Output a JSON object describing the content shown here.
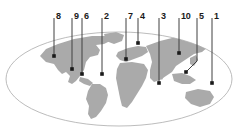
{
  "figure": {
    "width": 238,
    "height": 138,
    "background_color": "#ffffff"
  },
  "map": {
    "name": "world-map",
    "projection": "mollweide-ellipse",
    "land_color": "#aaaaaa",
    "ocean_color": "#ffffff",
    "outline_color": "#b4b4b4",
    "ellipse": {
      "cx": 119,
      "cy": 79,
      "rx": 113,
      "ry": 47
    }
  },
  "callouts": {
    "label_color": "#1a1a1a",
    "line_color": "#404040",
    "marker_color": "#1a1a1a",
    "items": [
      {
        "id": "callout-8",
        "label": "8",
        "label_x": 56,
        "label_y": 12,
        "line_x": 54,
        "line_y1": 18,
        "line_y2": 56,
        "dot_x": 54,
        "dot_y": 56,
        "bent": false
      },
      {
        "id": "callout-9",
        "label": "9",
        "label_x": 74,
        "label_y": 12,
        "line_x": 72,
        "line_y1": 18,
        "line_y2": 69,
        "dot_x": 72,
        "dot_y": 69,
        "bent": false
      },
      {
        "id": "callout-6",
        "label": "6",
        "label_x": 84,
        "label_y": 12,
        "line_x": 82,
        "line_y1": 18,
        "line_y2": 74,
        "dot_x": 82,
        "dot_y": 74,
        "bent": false
      },
      {
        "id": "callout-2",
        "label": "2",
        "label_x": 104,
        "label_y": 12,
        "line_x": 102,
        "line_y1": 18,
        "line_y2": 74,
        "dot_x": 102,
        "dot_y": 74,
        "bent": false
      },
      {
        "id": "callout-7",
        "label": "7",
        "label_x": 128,
        "label_y": 12,
        "line_x": 126,
        "line_y1": 18,
        "line_y2": 59,
        "dot_x": 126,
        "dot_y": 59,
        "bent": false
      },
      {
        "id": "callout-4",
        "label": "4",
        "label_x": 140,
        "label_y": 12,
        "line_x": 138,
        "line_y1": 18,
        "line_y2": 43,
        "dot_x": 138,
        "dot_y": 43,
        "bent": false
      },
      {
        "id": "callout-3",
        "label": "3",
        "label_x": 161,
        "label_y": 12,
        "line_x": 159,
        "line_y1": 18,
        "line_y2": 83,
        "dot_x": 159,
        "dot_y": 83,
        "bent": false
      },
      {
        "id": "callout-10",
        "label": "10",
        "label_x": 181,
        "label_y": 12,
        "line_x": 179,
        "line_y1": 18,
        "line_y2": 53,
        "dot_x": 179,
        "dot_y": 53,
        "bent": false
      },
      {
        "id": "callout-5",
        "label": "5",
        "label_x": 199,
        "label_y": 12,
        "line_x": 197,
        "line_y1": 18,
        "line_y2": 61,
        "dot_x": 186,
        "dot_y": 72,
        "bent": true
      },
      {
        "id": "callout-1",
        "label": "1",
        "label_x": 214,
        "label_y": 12,
        "line_x": 212,
        "line_y1": 18,
        "line_y2": 83,
        "dot_x": 212,
        "dot_y": 83,
        "bent": false
      }
    ]
  }
}
